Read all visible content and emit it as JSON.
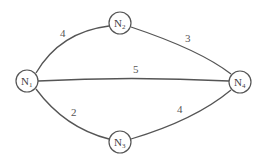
{
  "diagram": {
    "type": "weighted-undirected-graph",
    "nodes": [
      {
        "id": "N1",
        "base": "N",
        "sub": "1",
        "x": 27,
        "y": 81
      },
      {
        "id": "N2",
        "base": "N",
        "sub": "2",
        "x": 120,
        "y": 23
      },
      {
        "id": "N3",
        "base": "N",
        "sub": "3",
        "x": 120,
        "y": 142
      },
      {
        "id": "N4",
        "base": "N",
        "sub": "4",
        "x": 240,
        "y": 82
      }
    ],
    "edges": [
      {
        "from": "N1",
        "to": "N2",
        "weight": "4"
      },
      {
        "from": "N2",
        "to": "N4",
        "weight": "3"
      },
      {
        "from": "N1",
        "to": "N4",
        "weight": "5"
      },
      {
        "from": "N1",
        "to": "N3",
        "weight": "2"
      },
      {
        "from": "N3",
        "to": "N4",
        "weight": "4"
      }
    ]
  }
}
